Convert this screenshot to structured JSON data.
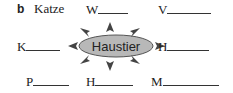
{
  "exercise": {
    "label": "b",
    "example_word": "Katze",
    "center_word": "Haustier",
    "words": [
      {
        "letter": "W",
        "position": "top-middle"
      },
      {
        "letter": "V",
        "position": "top-right"
      },
      {
        "letter": "K",
        "position": "middle-left"
      },
      {
        "letter": "H",
        "position": "middle-right"
      },
      {
        "letter": "P",
        "position": "bottom-left"
      },
      {
        "letter": "H",
        "position": "bottom-middle"
      },
      {
        "letter": "M",
        "position": "bottom-right"
      }
    ]
  },
  "colors": {
    "ellipse_fill": "#b8b8b8",
    "ellipse_stroke": "#555555",
    "arrow": "#444444",
    "text": "#222222"
  }
}
